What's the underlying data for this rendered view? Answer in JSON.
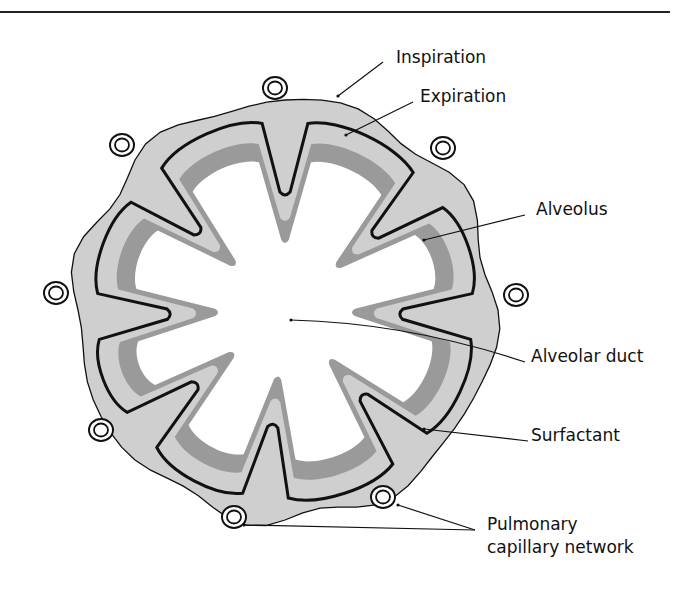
{
  "figure": {
    "colors": {
      "wall_fill": "#cfcfcf",
      "expiration_fill": "#9a9a9a",
      "lumen_fill": "#ffffff",
      "outline": "#111111",
      "background": "#ffffff"
    },
    "center": [
      285,
      310
    ],
    "outer_radius": 210,
    "inspiration_radius": 188,
    "expiration_radius": 168,
    "spike_angles_deg": [
      -90,
      -40,
      2,
      48,
      96,
      140,
      178,
      222
    ],
    "spike_tip_radius": 118,
    "expiration_tip_radius": 92,
    "capillaries": [
      {
        "x": 275,
        "y": 88
      },
      {
        "x": 122,
        "y": 145
      },
      {
        "x": 443,
        "y": 148
      },
      {
        "x": 56,
        "y": 293
      },
      {
        "x": 516,
        "y": 295
      },
      {
        "x": 101,
        "y": 430
      },
      {
        "x": 383,
        "y": 497
      },
      {
        "x": 234,
        "y": 517
      }
    ],
    "labels": [
      {
        "id": "inspiration",
        "text": "Inspiration",
        "x": 396,
        "y": 63,
        "line": [
          [
            383,
            62
          ],
          [
            338,
            96
          ]
        ]
      },
      {
        "id": "expiration",
        "text": "Expiration",
        "x": 420,
        "y": 102,
        "line": [
          [
            413,
            102
          ],
          [
            346,
            135
          ]
        ]
      },
      {
        "id": "alveolus",
        "text": "Alveolus",
        "x": 536,
        "y": 215,
        "line": [
          [
            525,
            215
          ],
          [
            424,
            240
          ]
        ]
      },
      {
        "id": "alveolar-duct",
        "text": "Alveolar duct",
        "x": 531,
        "y": 362,
        "line": [
          [
            525,
            362
          ],
          [
            291,
            320
          ]
        ]
      },
      {
        "id": "surfactant",
        "text": "Surfactant",
        "x": 531,
        "y": 441,
        "line": [
          [
            528,
            441
          ],
          [
            424,
            429
          ]
        ]
      },
      {
        "id": "pulmonary-capillary-network-1",
        "text": "Pulmonary",
        "x": 487,
        "y": 530,
        "line": [
          [
            475,
            530
          ],
          [
            398,
            505
          ]
        ]
      },
      {
        "id": "pulmonary-capillary-network-2",
        "text": "capillary network",
        "x": 487,
        "y": 553,
        "line": [
          [
            475,
            530
          ],
          [
            244,
            525
          ]
        ]
      }
    ]
  }
}
